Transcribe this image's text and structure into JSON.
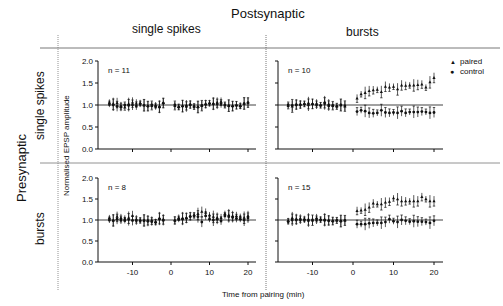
{
  "figure": {
    "top_title": "Postsynaptic",
    "left_title": "Presynaptic",
    "col_headers": [
      "single spikes",
      "bursts"
    ],
    "row_headers": [
      "single spikes",
      "bursts"
    ],
    "ylabel": "Normalised EPSP amplitude",
    "xlabel": "Time from pairing (min)",
    "legend": [
      {
        "label": "paired",
        "marker": "triangle"
      },
      {
        "label": "control",
        "marker": "circle"
      }
    ]
  },
  "chart_data": [
    {
      "type": "scatter",
      "title": "Presynaptic single spikes / Postsynaptic single spikes",
      "annotation": "n = 11",
      "xlabel": "Time from pairing (min)",
      "ylabel": "Normalised EPSP amplitude",
      "xticks": [
        -10,
        0,
        10,
        20
      ],
      "yticks": [
        0.0,
        0.5,
        1.0,
        1.5,
        2.0
      ],
      "ylim": [
        0,
        2.0
      ],
      "reference_line": 1.0,
      "series": [
        {
          "name": "paired",
          "x": [
            -16,
            -15,
            -14,
            -13,
            -12,
            -11,
            -10,
            -9,
            -8,
            -7,
            -6,
            -5,
            -4,
            -3,
            -2,
            1,
            2,
            3,
            4,
            5,
            6,
            7,
            8,
            9,
            10,
            11,
            12,
            13,
            14,
            15,
            16,
            17,
            18,
            19,
            20
          ],
          "values": [
            1.06,
            1.03,
            1.05,
            0.98,
            0.95,
            1.03,
            1.06,
            1.04,
            1.05,
            1.0,
            0.98,
            0.98,
            1.0,
            0.97,
            1.05,
            0.98,
            0.96,
            0.98,
            1.0,
            1.02,
            0.97,
            0.96,
            0.98,
            1.03,
            1.05,
            1.04,
            1.06,
            1.08,
            1.0,
            0.99,
            0.98,
            1.0,
            0.99,
            1.04,
            1.06
          ]
        },
        {
          "name": "control",
          "x": [
            -16,
            -15,
            -14,
            -13,
            -12,
            -11,
            -10,
            -9,
            -8,
            -7,
            -6,
            -5,
            -4,
            -3,
            -2,
            1,
            2,
            3,
            4,
            5,
            6,
            7,
            8,
            9,
            10,
            11,
            12,
            13,
            14,
            15,
            16,
            17,
            18,
            19,
            20
          ],
          "values": [
            1.02,
            1.0,
            0.97,
            0.95,
            1.0,
            0.99,
            1.0,
            0.98,
            1.02,
            0.99,
            0.97,
            1.0,
            0.96,
            0.95,
            1.04,
            1.0,
            0.95,
            0.97,
            0.96,
            1.0,
            0.96,
            0.95,
            0.99,
            1.01,
            1.03,
            1.02,
            1.02,
            1.03,
            1.0,
            0.98,
            0.97,
            0.99,
            0.97,
            1.03,
            1.05
          ]
        }
      ]
    },
    {
      "type": "scatter",
      "title": "Presynaptic single spikes / Postsynaptic bursts",
      "annotation": "n = 10",
      "xlabel": "Time from pairing (min)",
      "ylabel": "Normalised EPSP amplitude",
      "xticks": [
        -10,
        0,
        10,
        20
      ],
      "yticks": [
        0.0,
        0.5,
        1.0,
        1.5,
        2.0
      ],
      "ylim": [
        0,
        2.0
      ],
      "reference_line": 1.0,
      "series": [
        {
          "name": "paired",
          "x": [
            -16,
            -15,
            -14,
            -13,
            -12,
            -11,
            -10,
            -9,
            -8,
            -7,
            -6,
            -5,
            -4,
            -3,
            -2,
            1,
            2,
            3,
            4,
            5,
            6,
            7,
            8,
            9,
            10,
            11,
            12,
            13,
            14,
            15,
            16,
            17,
            18,
            19,
            20
          ],
          "values": [
            0.98,
            0.97,
            1.02,
            1.02,
            1.03,
            1.05,
            1.03,
            1.04,
            1.0,
            1.07,
            1.02,
            0.98,
            0.97,
            1.0,
            0.97,
            1.15,
            1.25,
            1.28,
            1.32,
            1.34,
            1.35,
            1.3,
            1.42,
            1.4,
            1.42,
            1.36,
            1.45,
            1.44,
            1.45,
            1.45,
            1.46,
            1.47,
            1.4,
            1.52,
            1.62
          ]
        },
        {
          "name": "control",
          "x": [
            -16,
            -15,
            -14,
            -13,
            -12,
            -11,
            -10,
            -9,
            -8,
            -7,
            -6,
            -5,
            -4,
            -3,
            -2,
            1,
            2,
            3,
            4,
            5,
            6,
            7,
            8,
            9,
            10,
            11,
            12,
            13,
            14,
            15,
            16,
            17,
            18,
            19,
            20
          ],
          "values": [
            1.0,
            0.99,
            1.0,
            1.0,
            1.02,
            1.0,
            1.02,
            1.0,
            0.99,
            1.03,
            0.98,
            0.99,
            0.97,
            1.0,
            0.98,
            0.85,
            0.88,
            0.86,
            0.82,
            0.81,
            0.82,
            0.88,
            0.83,
            0.82,
            0.83,
            0.82,
            0.86,
            0.82,
            0.84,
            0.84,
            0.84,
            0.85,
            0.84,
            0.82,
            0.83
          ]
        }
      ]
    },
    {
      "type": "scatter",
      "title": "Presynaptic bursts / Postsynaptic single spikes",
      "annotation": "n = 8",
      "xlabel": "Time from pairing (min)",
      "ylabel": "Normalised EPSP amplitude",
      "xticks": [
        -10,
        0,
        10,
        20
      ],
      "yticks": [
        0.0,
        0.5,
        1.0,
        1.5,
        2.0
      ],
      "ylim": [
        0,
        2.0
      ],
      "reference_line": 1.0,
      "series": [
        {
          "name": "paired",
          "x": [
            -16,
            -15,
            -14,
            -13,
            -12,
            -11,
            -10,
            -9,
            -8,
            -7,
            -6,
            -5,
            -4,
            -3,
            -2,
            1,
            2,
            3,
            4,
            5,
            6,
            7,
            8,
            9,
            10,
            11,
            12,
            13,
            14,
            15,
            16,
            17,
            18,
            19,
            20
          ],
          "values": [
            1.05,
            1.0,
            1.08,
            1.05,
            1.04,
            1.06,
            1.1,
            1.02,
            1.0,
            1.0,
            1.0,
            0.99,
            0.96,
            1.05,
            1.02,
            1.0,
            1.06,
            1.05,
            1.06,
            1.1,
            1.12,
            1.15,
            1.2,
            1.18,
            1.12,
            1.08,
            1.06,
            1.05,
            1.15,
            1.12,
            1.1,
            1.1,
            1.08,
            1.06,
            1.1
          ]
        },
        {
          "name": "control",
          "x": [
            -16,
            -15,
            -14,
            -13,
            -12,
            -11,
            -10,
            -9,
            -8,
            -7,
            -6,
            -5,
            -4,
            -3,
            -2,
            1,
            2,
            3,
            4,
            5,
            6,
            7,
            8,
            9,
            10,
            11,
            12,
            13,
            14,
            15,
            16,
            17,
            18,
            19,
            20
          ],
          "values": [
            1.0,
            0.98,
            1.02,
            1.0,
            0.99,
            1.01,
            0.99,
            0.98,
            0.98,
            0.98,
            0.97,
            0.96,
            0.94,
            1.02,
            0.99,
            0.98,
            1.02,
            1.02,
            1.04,
            1.08,
            1.1,
            1.08,
            0.95,
            1.1,
            1.02,
            1.0,
            1.02,
            0.98,
            1.1,
            1.08,
            1.06,
            1.04,
            1.02,
            1.0,
            1.05
          ]
        }
      ]
    },
    {
      "type": "scatter",
      "title": "Presynaptic bursts / Postsynaptic bursts",
      "annotation": "n = 15",
      "xlabel": "Time from pairing (min)",
      "ylabel": "Normalised EPSP amplitude",
      "xticks": [
        -10,
        0,
        10,
        20
      ],
      "yticks": [
        0.0,
        0.5,
        1.0,
        1.5,
        2.0
      ],
      "ylim": [
        0,
        2.0
      ],
      "reference_line": 1.0,
      "series": [
        {
          "name": "paired",
          "x": [
            -16,
            -15,
            -14,
            -13,
            -12,
            -11,
            -10,
            -9,
            -8,
            -7,
            -6,
            -5,
            -4,
            -3,
            -2,
            1,
            2,
            3,
            4,
            5,
            6,
            7,
            8,
            9,
            10,
            11,
            12,
            13,
            14,
            15,
            16,
            17,
            18,
            19,
            20
          ],
          "values": [
            0.98,
            1.05,
            1.03,
            1.04,
            1.03,
            1.02,
            0.99,
            1.05,
            1.02,
            1.02,
            1.0,
            0.98,
            0.99,
            0.98,
            0.99,
            1.22,
            1.23,
            1.25,
            1.3,
            1.4,
            1.38,
            1.38,
            1.42,
            1.44,
            1.52,
            1.5,
            1.45,
            1.45,
            1.45,
            1.45,
            1.45,
            1.55,
            1.5,
            1.45,
            1.45
          ]
        },
        {
          "name": "control",
          "x": [
            -16,
            -15,
            -14,
            -13,
            -12,
            -11,
            -10,
            -9,
            -8,
            -7,
            -6,
            -5,
            -4,
            -3,
            -2,
            1,
            2,
            3,
            4,
            5,
            6,
            7,
            8,
            9,
            10,
            11,
            12,
            13,
            14,
            15,
            16,
            17,
            18,
            19,
            20
          ],
          "values": [
            0.96,
            1.0,
            1.0,
            1.0,
            1.0,
            0.98,
            1.0,
            1.0,
            1.0,
            0.99,
            0.98,
            0.97,
            0.99,
            0.97,
            0.99,
            0.9,
            0.9,
            0.9,
            0.92,
            0.93,
            0.93,
            0.93,
            0.95,
            1.02,
            0.97,
            0.95,
            1.0,
            0.98,
            0.96,
            0.97,
            0.96,
            0.96,
            0.95,
            0.93,
            0.98
          ]
        }
      ]
    }
  ]
}
